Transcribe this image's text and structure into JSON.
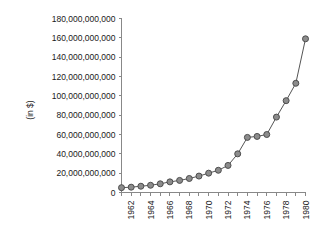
{
  "chart_data": {
    "type": "line",
    "title": "",
    "xlabel": "",
    "ylabel": "(in $)",
    "ylim": [
      0,
      180000000000
    ],
    "xlim": [
      1961,
      1980
    ],
    "grid": false,
    "legend": false,
    "ytick_labels": [
      "180,000,000,000",
      "160,000,000,000",
      "140,000,000,000",
      "120,000,000,000",
      "100,000,000,000",
      "80,000,000,000",
      "60,000,000,000",
      "40,000,000,000",
      "20,000,000,000",
      "0"
    ],
    "ytick_values": [
      180000000000,
      160000000000,
      140000000000,
      120000000000,
      100000000000,
      80000000000,
      60000000000,
      40000000000,
      20000000000,
      0
    ],
    "xtick_labels": [
      "1962",
      "1964",
      "1966",
      "1968",
      "1970",
      "1972",
      "1974",
      "1976",
      "1978",
      "1980"
    ],
    "xtick_values": [
      1962,
      1964,
      1966,
      1968,
      1970,
      1972,
      1974,
      1976,
      1978,
      1980
    ],
    "x": [
      1961,
      1962,
      1963,
      1964,
      1965,
      1966,
      1967,
      1968,
      1969,
      1970,
      1971,
      1972,
      1973,
      1974,
      1975,
      1976,
      1977,
      1978,
      1979,
      1980
    ],
    "values": [
      5000000000,
      5500000000,
      6500000000,
      7500000000,
      9000000000,
      11000000000,
      12500000000,
      14500000000,
      17000000000,
      20000000000,
      23000000000,
      28000000000,
      40000000000,
      57000000000,
      58000000000,
      60000000000,
      78000000000,
      95000000000,
      113000000000,
      159000000000
    ],
    "marker": "circle",
    "marker_fill": "#8c8c8c",
    "marker_edge": "#4d4d4d",
    "line_color": "#555555",
    "axis_color": "#888888",
    "background": "#ffffff"
  }
}
